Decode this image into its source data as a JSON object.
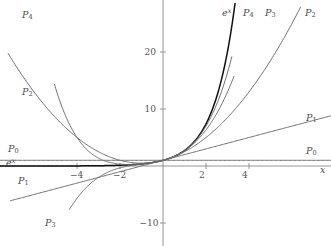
{
  "chart_data": {
    "type": "line",
    "title": "",
    "xlabel": "x",
    "ylabel": "",
    "xlim": [
      -7.6,
      7.8
    ],
    "ylim": [
      -13.5,
      26.0
    ],
    "grid": false,
    "legend_position": "inline-curve-end-labels",
    "axis_origin_px": {
      "x": 163,
      "y": 166
    },
    "px_per_unit": {
      "x": 21.5,
      "y": 5.7
    },
    "xticks": [
      -4,
      -2,
      2,
      4
    ],
    "xtick_labels": [
      "-4",
      "-2",
      "2",
      "4"
    ],
    "yticks": [
      -10,
      10,
      20
    ],
    "ytick_labels": [
      "-10",
      "10",
      "20"
    ],
    "series": [
      {
        "name": "e^x",
        "label": "e",
        "label_sup": "x",
        "expression": "exp(x)",
        "color": "#111111",
        "width": 1.5,
        "x": [
          -7.6,
          -7,
          -6,
          -5,
          -4,
          -3,
          -2,
          -1.5,
          -1,
          -0.5,
          0,
          0.5,
          1,
          1.5,
          2,
          2.5,
          3,
          3.2,
          3.35
        ],
        "y": [
          0.0005,
          0.0009,
          0.0025,
          0.0067,
          0.0183,
          0.0498,
          0.1353,
          0.2231,
          0.3679,
          0.6065,
          1,
          1.6487,
          2.7183,
          4.4817,
          7.389,
          12.182,
          20.086,
          24.53,
          28.5
        ]
      },
      {
        "name": "P0",
        "label": "P",
        "label_sub": "0",
        "expression": "1",
        "color": "#6e6e6e",
        "width": 1,
        "x": [
          -7.6,
          7.8
        ],
        "y": [
          1,
          1
        ]
      },
      {
        "name": "P1",
        "label": "P",
        "label_sub": "1",
        "expression": "1 + x",
        "color": "#6e6e6e",
        "width": 1,
        "x": [
          -7.1,
          7.8
        ],
        "y": [
          -6.1,
          8.8
        ]
      },
      {
        "name": "P2",
        "label": "P",
        "label_sub": "2",
        "expression": "1 + x + x^2/2",
        "color": "#6e6e6e",
        "width": 1,
        "x": [
          -7.2,
          -6,
          -5,
          -4,
          -3,
          -2,
          -1,
          0,
          1,
          2,
          3,
          4,
          5,
          6,
          6.4
        ],
        "y": [
          19.72,
          13,
          8.5,
          5,
          2.5,
          1,
          0.5,
          1,
          2.5,
          5,
          8.5,
          13,
          18.5,
          25,
          27.5
        ]
      },
      {
        "name": "P3",
        "label": "P",
        "label_sub": "3",
        "expression": "1 + x + x^2/2 + x^3/6",
        "color": "#6e6e6e",
        "width": 1,
        "x": [
          -4.35,
          -4,
          -3.5,
          -3,
          -2.5,
          -2,
          -1.5,
          -1,
          -0.5,
          0,
          0.5,
          1,
          1.5,
          2,
          2.5,
          3,
          3.3
        ],
        "y": [
          -8.7,
          -5.67,
          -2.646,
          -2.0,
          -0.104,
          0.3333,
          0.3125,
          0.3333,
          0.5208,
          1,
          1.6458,
          2.6667,
          4.1875,
          6.3333,
          9.2708,
          13,
          15.5
        ]
      },
      {
        "name": "P4",
        "label": "P",
        "label_sub": "4",
        "expression": "1 + x + x^2/2 + x^3/6 + x^4/24",
        "color": "#6e6e6e",
        "width": 1,
        "x": [
          -5.05,
          -5,
          -4.5,
          -4,
          -3.5,
          -3,
          -2.5,
          -2,
          -1.5,
          -1,
          -0.5,
          0,
          0.5,
          1,
          1.5,
          2,
          2.5,
          3,
          3.2
        ],
        "y": [
          21.5,
          20.375,
          11.39,
          5.0,
          12.65,
          3.625,
          2.609,
          1.667,
          0.9219,
          0.375,
          0.3411,
          1,
          1.6484,
          2.7083,
          4.3984,
          7.0,
          10.8,
          16.375,
          20.0
        ]
      }
    ],
    "curve_labels_left": [
      {
        "name": "P4",
        "text": "P",
        "sub": "4",
        "x_px": 22,
        "y_px": 10
      },
      {
        "name": "P2",
        "text": "P",
        "sub": "2",
        "x_px": 22,
        "y_px": 87
      },
      {
        "name": "P0",
        "text": "P",
        "sub": "0",
        "x_px": 8,
        "y_px": 144
      },
      {
        "name": "ex",
        "text": "e",
        "sup": "x",
        "x_px": 6,
        "y_px": 158
      },
      {
        "name": "P1",
        "text": "P",
        "sub": "1",
        "x_px": 18,
        "y_px": 176
      },
      {
        "name": "P3",
        "text": "P",
        "sub": "3",
        "x_px": 45,
        "y_px": 218
      }
    ],
    "curve_labels_right": [
      {
        "name": "ex",
        "text": "e",
        "sup": "x",
        "x_px": 222,
        "y_px": 8
      },
      {
        "name": "P4",
        "text": "P",
        "sub": "4",
        "x_px": 243,
        "y_px": 8
      },
      {
        "name": "P3",
        "text": "P",
        "sub": "3",
        "x_px": 265,
        "y_px": 8
      },
      {
        "name": "P2",
        "text": "P",
        "sub": "2",
        "x_px": 305,
        "y_px": 8
      },
      {
        "name": "P1",
        "text": "P",
        "sub": "1",
        "x_px": 306,
        "y_px": 113
      },
      {
        "name": "P0",
        "text": "P",
        "sub": "0",
        "x_px": 306,
        "y_px": 146
      },
      {
        "name": "xaxis",
        "text": "x",
        "x_px": 320,
        "y_px": 165
      }
    ],
    "colors": {
      "axis": "#8a8a8a",
      "curve_gray": "#6e6e6e",
      "curve_black": "#111111",
      "text": "#4a4a4a",
      "background": "#ffffff"
    }
  }
}
